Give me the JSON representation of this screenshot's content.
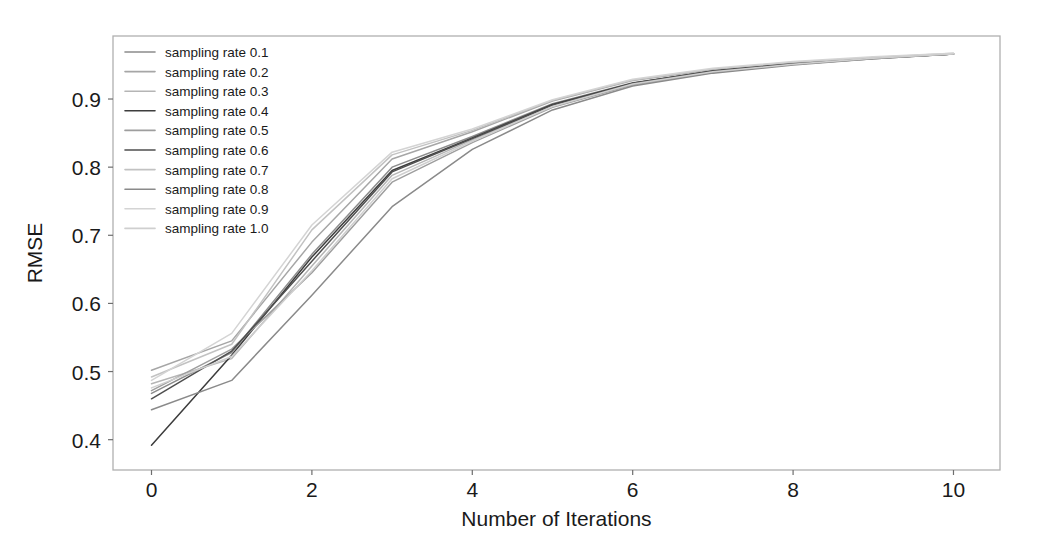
{
  "chart_data": {
    "type": "line",
    "title": "",
    "xlabel": "Number of Iterations",
    "ylabel": "RMSE",
    "xlim": [
      -0.48,
      10.58
    ],
    "ylim": [
      0.3555,
      0.9925
    ],
    "xticks": [
      0,
      2,
      4,
      6,
      8,
      10
    ],
    "xticklabels": [
      "0",
      "2",
      "4",
      "6",
      "8",
      "10"
    ],
    "yticks": [
      0.4,
      0.5,
      0.6,
      0.7,
      0.8,
      0.9
    ],
    "yticklabels": [
      "0.4",
      "0.5",
      "0.6",
      "0.7",
      "0.8",
      "0.9"
    ],
    "grid": false,
    "legend_position": "upper left",
    "legend_frame": false,
    "x": [
      0,
      1,
      2,
      3,
      4,
      5,
      6,
      7,
      8,
      9,
      10
    ],
    "series": [
      {
        "name": "sampling rate 0.1",
        "color": "#8c8c8c",
        "values": [
          0.468,
          0.528,
          0.672,
          0.8,
          0.845,
          0.893,
          0.924,
          0.941,
          0.952,
          0.96,
          0.966
        ]
      },
      {
        "name": "sampling rate 0.2",
        "color": "#a6a6a6",
        "values": [
          0.502,
          0.545,
          0.69,
          0.812,
          0.852,
          0.897,
          0.927,
          0.943,
          0.953,
          0.961,
          0.966
        ]
      },
      {
        "name": "sampling rate 0.3",
        "color": "#b5b5b5",
        "values": [
          0.482,
          0.519,
          0.655,
          0.788,
          0.84,
          0.89,
          0.922,
          0.94,
          0.951,
          0.959,
          0.966
        ]
      },
      {
        "name": "sampling rate 0.4",
        "color": "#3d3d3d",
        "values": [
          0.392,
          0.524,
          0.668,
          0.795,
          0.843,
          0.892,
          0.923,
          0.941,
          0.952,
          0.96,
          0.966
        ]
      },
      {
        "name": "sampling rate 0.5",
        "color": "#9e9e9e",
        "values": [
          0.472,
          0.533,
          0.645,
          0.778,
          0.836,
          0.888,
          0.921,
          0.939,
          0.951,
          0.959,
          0.966
        ]
      },
      {
        "name": "sampling rate 0.6",
        "color": "#4f4f4f",
        "values": [
          0.46,
          0.53,
          0.662,
          0.793,
          0.842,
          0.891,
          0.923,
          0.941,
          0.952,
          0.96,
          0.966
        ]
      },
      {
        "name": "sampling rate 0.7",
        "color": "#c2c2c2",
        "values": [
          0.492,
          0.54,
          0.708,
          0.818,
          0.854,
          0.898,
          0.928,
          0.944,
          0.954,
          0.961,
          0.967
        ]
      },
      {
        "name": "sampling rate 0.8",
        "color": "#8a8a8a",
        "values": [
          0.444,
          0.487,
          0.612,
          0.742,
          0.826,
          0.884,
          0.919,
          0.938,
          0.95,
          0.959,
          0.966
        ]
      },
      {
        "name": "sampling rate 0.9",
        "color": "#d4d4d4",
        "values": [
          0.487,
          0.556,
          0.715,
          0.822,
          0.856,
          0.899,
          0.929,
          0.945,
          0.955,
          0.962,
          0.967
        ]
      },
      {
        "name": "sampling rate 1.0",
        "color": "#cfcfcf",
        "values": [
          0.476,
          0.522,
          0.648,
          0.783,
          0.838,
          0.889,
          0.922,
          0.94,
          0.951,
          0.96,
          0.966
        ]
      }
    ]
  }
}
